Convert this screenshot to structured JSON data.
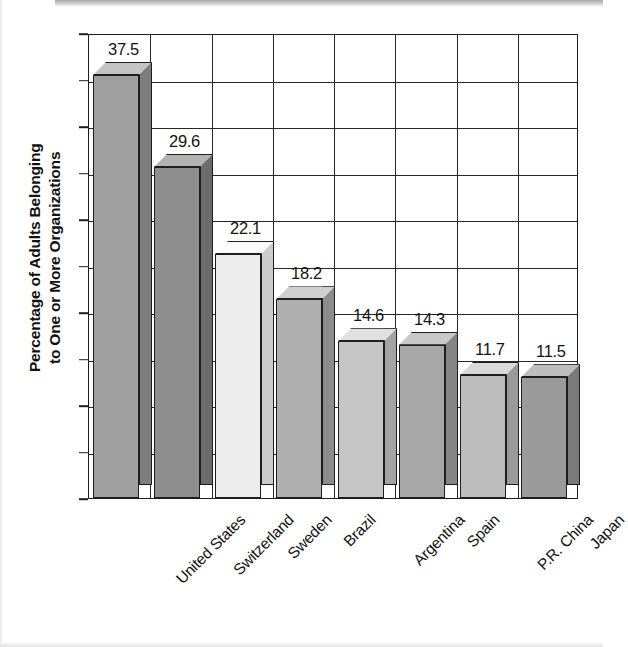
{
  "chart_data": {
    "type": "bar",
    "title": "",
    "subtitle": "",
    "xlabel": "",
    "ylabel": "Percentage of Adults Belonging\nto One or More Organizations",
    "categories": [
      "United States",
      "Switzerland",
      "Sweden",
      "Brazil",
      "Argentina",
      "Spain",
      "P.R. China",
      "Japan"
    ],
    "values": [
      37.5,
      29.6,
      22.1,
      18.2,
      14.6,
      14.3,
      11.7,
      11.5
    ],
    "value_labels": [
      "37.5",
      "29.6",
      "22.1",
      "18.2",
      "14.6",
      "14.3",
      "11.7",
      "11.5"
    ],
    "ylim": [
      0,
      40
    ],
    "ytick_labels": [
      "0",
      "4",
      "8",
      "12",
      "16",
      "20",
      "24",
      "28",
      "32",
      "36",
      "40"
    ],
    "ytick_values": [
      0,
      4,
      8,
      12,
      16,
      20,
      24,
      28,
      32,
      36,
      40
    ],
    "grid": true,
    "legend": "none",
    "style": "3d-bars-grayscale",
    "bar_colors": [
      "#a0a0a0",
      "#8e8e8e",
      "#ededed",
      "#b0b0b0",
      "#c6c6c6",
      "#a8a8a8",
      "#bdbdbd",
      "#9b9b9b"
    ],
    "bar_top_colors": [
      "#c4c4c4",
      "#b3b3b3",
      "#fbfbfb",
      "#cfcfcf",
      "#e0e0e0",
      "#c8c8c8",
      "#d9d9d9",
      "#bdbdbd"
    ],
    "bar_side_colors": [
      "#7d7d7d",
      "#6c6c6c",
      "#cccccc",
      "#8c8c8c",
      "#a3a3a3",
      "#858585",
      "#9a9a9a",
      "#7a7a7a"
    ],
    "axis_color": "#1d1d1d",
    "background_color": "#ffffff"
  }
}
